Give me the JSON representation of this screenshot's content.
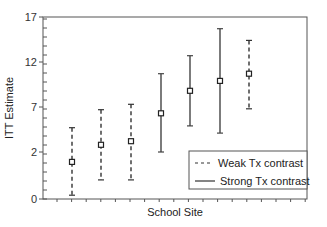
{
  "chart_data": {
    "type": "errorbar",
    "title": "",
    "xlabel": "School Site",
    "ylabel": "ITT Estimate",
    "ylim": [
      -3,
      17
    ],
    "yticks": [
      0,
      2,
      7,
      12,
      17
    ],
    "ytick_labels": [
      "0",
      "2",
      "7",
      "12",
      "17"
    ],
    "grid": false,
    "legend_position": "lower right",
    "legend": [
      {
        "label": "Weak Tx contrast",
        "style": "dashed"
      },
      {
        "label": "Strong Tx contrast",
        "style": "solid"
      }
    ],
    "points": [
      {
        "site": 1,
        "estimate": 0.9,
        "lower": -2.8,
        "upper": 4.7,
        "group": "Weak Tx contrast"
      },
      {
        "site": 2,
        "estimate": 2.8,
        "lower": -1.1,
        "upper": 6.7,
        "group": "Weak Tx contrast"
      },
      {
        "site": 3,
        "estimate": 3.2,
        "lower": -1.1,
        "upper": 7.3,
        "group": "Weak Tx contrast"
      },
      {
        "site": 4,
        "estimate": 6.3,
        "lower": 2.0,
        "upper": 10.7,
        "group": "Strong Tx contrast"
      },
      {
        "site": 5,
        "estimate": 8.8,
        "lower": 4.9,
        "upper": 12.7,
        "group": "Strong Tx contrast"
      },
      {
        "site": 6,
        "estimate": 9.9,
        "lower": 4.1,
        "upper": 15.7,
        "group": "Strong Tx contrast"
      },
      {
        "site": 7,
        "estimate": 10.7,
        "lower": 6.8,
        "upper": 14.4,
        "group": "Weak Tx contrast"
      }
    ]
  },
  "labels": {
    "xlabel": "School Site",
    "ylabel": "ITT Estimate",
    "legend_weak": "Weak Tx contrast",
    "legend_strong": "Strong Tx contrast",
    "yticks": [
      "0",
      "2",
      "7",
      "12",
      "17"
    ]
  }
}
